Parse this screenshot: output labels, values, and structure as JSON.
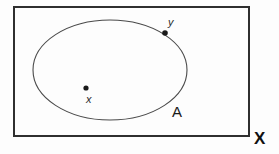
{
  "diagram": {
    "kind": "set-diagram",
    "background_color": "#fdfdfd",
    "stroke_color": "#3a3a3a",
    "universe": {
      "shape": "rectangle",
      "label": "X",
      "label_color": "#111111",
      "border_color": "#2f2f2f",
      "border_width_px": 2,
      "x": 13,
      "y": 6,
      "width": 237,
      "height": 131
    },
    "subset": {
      "shape": "ellipse",
      "label": "A",
      "label_color": "#1a1a1a",
      "border_color": "#4a4a4a",
      "border_width_px": 1,
      "center_x": 110,
      "center_y": 70,
      "radius_x": 77,
      "radius_y": 50
    },
    "points": [
      {
        "label": "x",
        "name": "interior-point",
        "cx": 86,
        "cy": 88,
        "radius_px": 2.6,
        "color": "#1a1a1a"
      },
      {
        "label": "y",
        "name": "boundary-point",
        "cx": 165,
        "cy": 33,
        "radius_px": 2.8,
        "color": "#1a1a1a"
      }
    ]
  }
}
